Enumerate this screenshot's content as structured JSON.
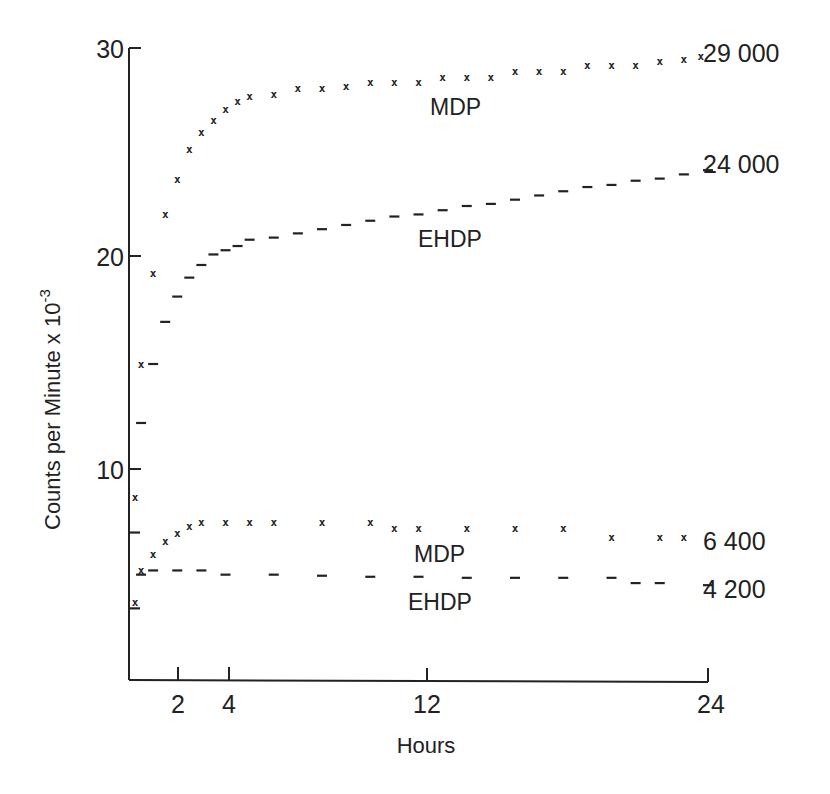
{
  "chart_data": {
    "type": "scatter",
    "title": "",
    "xlabel": "Hours",
    "ylabel": "Counts per Minute x 10^-3",
    "ylabel_parts": {
      "main": "Counts per Minute x 10",
      "exponent": "-3"
    },
    "xlim": [
      0,
      24
    ],
    "ylim": [
      0,
      30
    ],
    "x_ticks": [
      2,
      4,
      12,
      24
    ],
    "x_tick_labels": [
      "2",
      "4",
      "12",
      "24"
    ],
    "y_ticks": [
      10,
      20,
      30
    ],
    "y_tick_labels": [
      "10",
      "20",
      "30"
    ],
    "grid": false,
    "legend": "inline labels",
    "series": [
      {
        "name": "MDP (upper)",
        "label": "MDP",
        "marker": "x",
        "end_label": "29 000",
        "x": [
          0.25,
          0.5,
          1.0,
          1.5,
          2.0,
          2.5,
          3.0,
          3.5,
          4.0,
          4.5,
          5.0,
          6.0,
          7.0,
          8.0,
          9.0,
          10.0,
          11.0,
          12.0,
          13.0,
          14.0,
          15.0,
          16.0,
          17.0,
          18.0,
          19.0,
          20.0,
          21.0,
          22.0,
          23.0,
          23.7
        ],
        "values": [
          8.7,
          15.0,
          19.3,
          22.1,
          23.8,
          25.2,
          26.0,
          26.6,
          27.1,
          27.5,
          27.7,
          27.8,
          28.1,
          28.1,
          28.2,
          28.4,
          28.4,
          28.4,
          28.6,
          28.6,
          28.6,
          28.9,
          28.9,
          28.9,
          29.2,
          29.2,
          29.2,
          29.4,
          29.5,
          29.6
        ]
      },
      {
        "name": "EHDP (upper)",
        "label": "EHDP",
        "marker": "-",
        "end_label": "24 000",
        "x": [
          0.25,
          0.5,
          1.0,
          1.5,
          2.0,
          2.5,
          3.0,
          3.5,
          4.0,
          4.5,
          5.0,
          6.0,
          7.0,
          8.0,
          9.0,
          10.0,
          11.0,
          12.0,
          13.0,
          14.0,
          15.0,
          16.0,
          17.0,
          18.0,
          19.0,
          20.0,
          21.0,
          22.0,
          23.0,
          24.0
        ],
        "values": [
          7.0,
          12.2,
          15.0,
          17.0,
          18.2,
          19.1,
          19.7,
          20.2,
          20.4,
          20.6,
          20.9,
          21.0,
          21.2,
          21.4,
          21.6,
          21.8,
          22.0,
          22.1,
          22.3,
          22.5,
          22.6,
          22.8,
          23.0,
          23.2,
          23.4,
          23.5,
          23.7,
          23.8,
          24.0,
          24.2
        ]
      },
      {
        "name": "MDP (lower)",
        "label": "MDP",
        "marker": "x",
        "end_label": "6 400",
        "x": [
          0.25,
          0.5,
          1.0,
          1.5,
          2.0,
          2.5,
          3.0,
          4.0,
          5.0,
          6.0,
          8.0,
          10.0,
          11.0,
          12.0,
          14.0,
          16.0,
          18.0,
          20.0,
          22.0,
          23.0
        ],
        "values": [
          3.7,
          5.2,
          6.0,
          6.6,
          7.0,
          7.3,
          7.5,
          7.5,
          7.5,
          7.5,
          7.5,
          7.5,
          7.2,
          7.2,
          7.2,
          7.2,
          7.2,
          6.8,
          6.8,
          6.8
        ]
      },
      {
        "name": "EHDP (lower)",
        "label": "EHDP",
        "marker": "-",
        "end_label": "4 200",
        "x": [
          0.25,
          0.5,
          1.0,
          2.0,
          3.0,
          4.0,
          6.0,
          8.0,
          10.0,
          12.0,
          14.0,
          16.0,
          18.0,
          20.0,
          21.0,
          22.0,
          24.0
        ],
        "values": [
          3.4,
          5.0,
          5.2,
          5.2,
          5.2,
          5.0,
          5.0,
          4.95,
          4.9,
          4.9,
          4.85,
          4.85,
          4.85,
          4.85,
          4.6,
          4.6,
          4.5
        ]
      }
    ],
    "annotations": [
      {
        "text": "MDP",
        "near_series": "MDP (upper)"
      },
      {
        "text": "EHDP",
        "near_series": "EHDP (upper)"
      },
      {
        "text": "MDP",
        "near_series": "MDP (lower)"
      },
      {
        "text": "EHDP",
        "near_series": "EHDP (lower)"
      },
      {
        "text": "29 000",
        "position": "right end of MDP (upper)"
      },
      {
        "text": "24 000",
        "position": "right end of EHDP (upper)"
      },
      {
        "text": "6 400",
        "position": "right end of MDP (lower)"
      },
      {
        "text": "4 200",
        "position": "right end of EHDP (lower)"
      }
    ]
  },
  "labels": {
    "xlabel": "Hours",
    "ylabel_main": "Counts per Minute x 10",
    "ylabel_exp": "-3",
    "ytick_30": "30",
    "ytick_20": "20",
    "ytick_10": "10",
    "xtick_2": "2",
    "xtick_4": "4",
    "xtick_12": "12",
    "xtick_24": "24",
    "mdp_upper": "MDP",
    "ehdp_upper": "EHDP",
    "mdp_lower": "MDP",
    "ehdp_lower": "EHDP",
    "end_29000": "29 000",
    "end_24000": "24 000",
    "end_6400": "6 400",
    "end_4200": "4 200"
  }
}
